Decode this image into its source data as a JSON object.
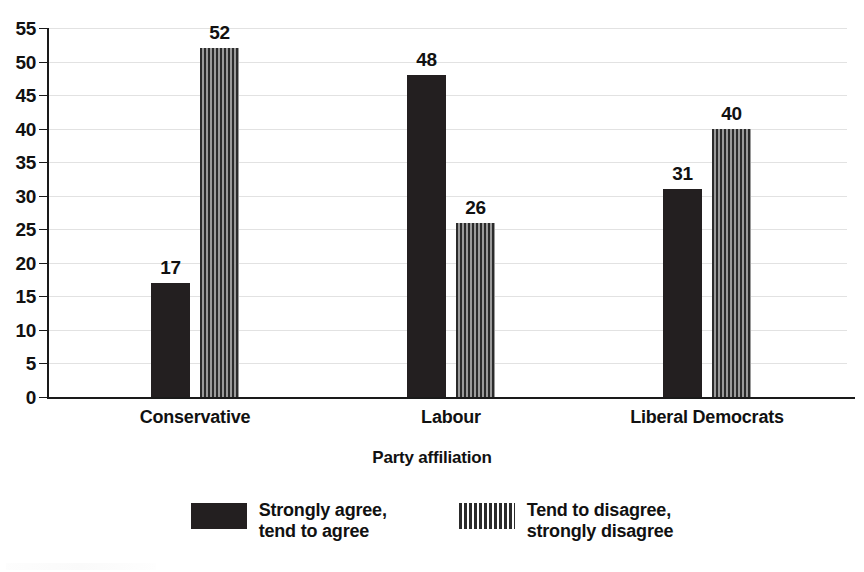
{
  "chart_data": {
    "type": "bar",
    "title": "",
    "xlabel": "Party affiliation",
    "ylabel": "",
    "categories": [
      "Conservative",
      "Labour",
      "Liberal Democrats"
    ],
    "series": [
      {
        "name": "Strongly agree,\ntend to agree",
        "fill": "solid",
        "color": "#231f20",
        "values": [
          17,
          48,
          31
        ]
      },
      {
        "name": "Tend to disagree,\nstrongly disagree",
        "fill": "striped",
        "color": "#2b2b2b",
        "values": [
          52,
          26,
          40
        ]
      }
    ],
    "ylim": [
      0,
      55
    ],
    "yticks": [
      0,
      5,
      10,
      15,
      20,
      25,
      30,
      35,
      40,
      45,
      50,
      55
    ],
    "grid": true,
    "legend_position": "bottom"
  },
  "axis": {
    "x_title": "Party affiliation"
  },
  "legend": {
    "items": [
      {
        "label": "Strongly agree,\ntend to agree",
        "fill": "solid"
      },
      {
        "label": "Tend to disagree,\nstrongly disagree",
        "fill": "striped"
      }
    ]
  },
  "colors": {
    "series_solid": "#231f20",
    "series_striped": "#2b2b2b",
    "gridline": "#e2e2e2",
    "axis": "#1a1a1a",
    "text": "#111111",
    "background": "#ffffff"
  }
}
